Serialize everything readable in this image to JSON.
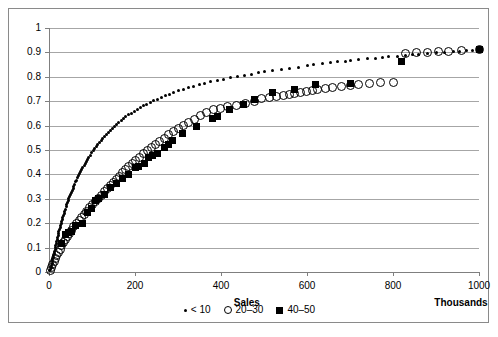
{
  "chart_data": {
    "type": "scatter",
    "title": "",
    "xlabel": "Sales",
    "xunits": "Thousands",
    "ylabel": "",
    "xlim": [
      0,
      1000
    ],
    "ylim": [
      0,
      1
    ],
    "grid": true,
    "legend_position": "bottom-center",
    "xticks": [
      "0",
      "200",
      "400",
      "600",
      "800",
      "1000"
    ],
    "xtick_values": [
      0,
      200,
      400,
      600,
      800,
      1000
    ],
    "yticks": [
      "0",
      "0.1",
      "0.2",
      "0.3",
      "0.4",
      "0.5",
      "0.6",
      "0.7",
      "0.8",
      "0.9",
      "1"
    ],
    "ytick_values": [
      0,
      0.1,
      0.2,
      0.3,
      0.4,
      0.5,
      0.6,
      0.7,
      0.8,
      0.9,
      1
    ],
    "series": [
      {
        "name": "< 10",
        "marker": "small-dot",
        "color": "#000000",
        "points": [
          [
            2,
            0.005
          ],
          [
            4,
            0.012
          ],
          [
            5,
            0.02
          ],
          [
            6,
            0.028
          ],
          [
            7,
            0.036
          ],
          [
            8,
            0.044
          ],
          [
            9,
            0.052
          ],
          [
            10,
            0.06
          ],
          [
            11,
            0.068
          ],
          [
            12,
            0.076
          ],
          [
            13,
            0.085
          ],
          [
            14,
            0.093
          ],
          [
            15,
            0.101
          ],
          [
            16,
            0.11
          ],
          [
            17,
            0.118
          ],
          [
            18,
            0.126
          ],
          [
            19,
            0.134
          ],
          [
            20,
            0.142
          ],
          [
            21,
            0.15
          ],
          [
            22,
            0.158
          ],
          [
            23,
            0.166
          ],
          [
            25,
            0.175
          ],
          [
            26,
            0.183
          ],
          [
            27,
            0.191
          ],
          [
            28,
            0.199
          ],
          [
            30,
            0.208
          ],
          [
            31,
            0.216
          ],
          [
            32,
            0.224
          ],
          [
            34,
            0.233
          ],
          [
            35,
            0.241
          ],
          [
            37,
            0.25
          ],
          [
            38,
            0.258
          ],
          [
            40,
            0.267
          ],
          [
            41,
            0.275
          ],
          [
            43,
            0.284
          ],
          [
            45,
            0.292
          ],
          [
            46,
            0.301
          ],
          [
            48,
            0.309
          ],
          [
            50,
            0.318
          ],
          [
            52,
            0.326
          ],
          [
            54,
            0.335
          ],
          [
            56,
            0.343
          ],
          [
            58,
            0.352
          ],
          [
            60,
            0.36
          ],
          [
            62,
            0.369
          ],
          [
            64,
            0.377
          ],
          [
            66,
            0.386
          ],
          [
            69,
            0.394
          ],
          [
            71,
            0.403
          ],
          [
            74,
            0.411
          ],
          [
            76,
            0.42
          ],
          [
            79,
            0.428
          ],
          [
            82,
            0.437
          ],
          [
            84,
            0.445
          ],
          [
            87,
            0.454
          ],
          [
            90,
            0.462
          ],
          [
            93,
            0.471
          ],
          [
            96,
            0.479
          ],
          [
            99,
            0.488
          ],
          [
            103,
            0.496
          ],
          [
            106,
            0.505
          ],
          [
            110,
            0.513
          ],
          [
            113,
            0.522
          ],
          [
            117,
            0.53
          ],
          [
            121,
            0.538
          ],
          [
            125,
            0.547
          ],
          [
            129,
            0.555
          ],
          [
            133,
            0.563
          ],
          [
            138,
            0.572
          ],
          [
            142,
            0.58
          ],
          [
            147,
            0.588
          ],
          [
            152,
            0.596
          ],
          [
            157,
            0.604
          ],
          [
            162,
            0.612
          ],
          [
            168,
            0.62
          ],
          [
            173,
            0.628
          ],
          [
            179,
            0.636
          ],
          [
            185,
            0.644
          ],
          [
            191,
            0.651
          ],
          [
            198,
            0.659
          ],
          [
            205,
            0.666
          ],
          [
            212,
            0.674
          ],
          [
            219,
            0.681
          ],
          [
            227,
            0.688
          ],
          [
            235,
            0.695
          ],
          [
            243,
            0.702
          ],
          [
            252,
            0.709
          ],
          [
            261,
            0.716
          ],
          [
            270,
            0.723
          ],
          [
            280,
            0.729
          ],
          [
            290,
            0.736
          ],
          [
            301,
            0.742
          ],
          [
            312,
            0.748
          ],
          [
            324,
            0.755
          ],
          [
            336,
            0.761
          ],
          [
            349,
            0.767
          ],
          [
            362,
            0.773
          ],
          [
            376,
            0.779
          ],
          [
            391,
            0.784
          ],
          [
            406,
            0.79
          ],
          [
            422,
            0.796
          ],
          [
            438,
            0.801
          ],
          [
            455,
            0.806
          ],
          [
            470,
            0.811
          ],
          [
            487,
            0.816
          ],
          [
            500,
            0.82
          ],
          [
            520,
            0.825
          ],
          [
            540,
            0.83
          ],
          [
            560,
            0.835
          ],
          [
            580,
            0.84
          ],
          [
            600,
            0.845
          ],
          [
            615,
            0.849
          ],
          [
            635,
            0.853
          ],
          [
            655,
            0.857
          ],
          [
            672,
            0.861
          ],
          [
            690,
            0.864
          ],
          [
            700,
            0.866
          ],
          [
            720,
            0.87
          ],
          [
            740,
            0.874
          ],
          [
            760,
            0.877
          ],
          [
            775,
            0.879
          ],
          [
            790,
            0.882
          ],
          [
            810,
            0.885
          ],
          [
            830,
            0.888
          ],
          [
            845,
            0.89
          ],
          [
            860,
            0.892
          ],
          [
            880,
            0.895
          ],
          [
            900,
            0.898
          ],
          [
            920,
            0.9
          ],
          [
            940,
            0.903
          ],
          [
            955,
            0.905
          ],
          [
            970,
            0.907
          ],
          [
            985,
            0.909
          ],
          [
            1000,
            0.912
          ]
        ]
      },
      {
        "name": "20–30",
        "marker": "open-circle",
        "color": "#000000",
        "points": [
          [
            3,
            0.008
          ],
          [
            6,
            0.018
          ],
          [
            9,
            0.03
          ],
          [
            12,
            0.042
          ],
          [
            15,
            0.055
          ],
          [
            18,
            0.068
          ],
          [
            22,
            0.081
          ],
          [
            26,
            0.094
          ],
          [
            30,
            0.107
          ],
          [
            34,
            0.12
          ],
          [
            38,
            0.133
          ],
          [
            43,
            0.146
          ],
          [
            48,
            0.159
          ],
          [
            53,
            0.172
          ],
          [
            58,
            0.185
          ],
          [
            64,
            0.198
          ],
          [
            70,
            0.211
          ],
          [
            76,
            0.224
          ],
          [
            82,
            0.237
          ],
          [
            88,
            0.25
          ],
          [
            95,
            0.263
          ],
          [
            101,
            0.276
          ],
          [
            108,
            0.289
          ],
          [
            115,
            0.302
          ],
          [
            122,
            0.315
          ],
          [
            128,
            0.328
          ],
          [
            135,
            0.341
          ],
          [
            142,
            0.354
          ],
          [
            149,
            0.367
          ],
          [
            156,
            0.38
          ],
          [
            163,
            0.393
          ],
          [
            170,
            0.406
          ],
          [
            178,
            0.419
          ],
          [
            186,
            0.432
          ],
          [
            194,
            0.445
          ],
          [
            202,
            0.458
          ],
          [
            210,
            0.471
          ],
          [
            219,
            0.484
          ],
          [
            228,
            0.497
          ],
          [
            238,
            0.51
          ],
          [
            248,
            0.523
          ],
          [
            258,
            0.536
          ],
          [
            268,
            0.549
          ],
          [
            278,
            0.562
          ],
          [
            289,
            0.575
          ],
          [
            300,
            0.588
          ],
          [
            312,
            0.601
          ],
          [
            325,
            0.614
          ],
          [
            338,
            0.627
          ],
          [
            352,
            0.64
          ],
          [
            367,
            0.653
          ],
          [
            382,
            0.664
          ],
          [
            398,
            0.672
          ],
          [
            415,
            0.678
          ],
          [
            435,
            0.684
          ],
          [
            458,
            0.69
          ],
          [
            478,
            0.7
          ],
          [
            495,
            0.71
          ],
          [
            512,
            0.714
          ],
          [
            528,
            0.718
          ],
          [
            545,
            0.722
          ],
          [
            560,
            0.726
          ],
          [
            572,
            0.73
          ],
          [
            585,
            0.734
          ],
          [
            598,
            0.738
          ],
          [
            612,
            0.742
          ],
          [
            625,
            0.748
          ],
          [
            642,
            0.753
          ],
          [
            660,
            0.758
          ],
          [
            680,
            0.762
          ],
          [
            700,
            0.766
          ],
          [
            720,
            0.769
          ],
          [
            745,
            0.772
          ],
          [
            770,
            0.775
          ],
          [
            800,
            0.778
          ],
          [
            830,
            0.896
          ],
          [
            855,
            0.898
          ],
          [
            880,
            0.9
          ],
          [
            905,
            0.902
          ],
          [
            930,
            0.904
          ],
          [
            960,
            0.908
          ],
          [
            1000,
            0.912
          ]
        ]
      },
      {
        "name": "40–50",
        "marker": "filled-square",
        "color": "#000000",
        "points": [
          [
            30,
            0.115
          ],
          [
            38,
            0.155
          ],
          [
            45,
            0.163
          ],
          [
            52,
            0.168
          ],
          [
            62,
            0.19
          ],
          [
            78,
            0.2
          ],
          [
            90,
            0.245
          ],
          [
            98,
            0.262
          ],
          [
            108,
            0.295
          ],
          [
            115,
            0.302
          ],
          [
            128,
            0.318
          ],
          [
            142,
            0.345
          ],
          [
            158,
            0.362
          ],
          [
            172,
            0.382
          ],
          [
            186,
            0.398
          ],
          [
            200,
            0.428
          ],
          [
            208,
            0.432
          ],
          [
            222,
            0.445
          ],
          [
            232,
            0.468
          ],
          [
            240,
            0.478
          ],
          [
            252,
            0.485
          ],
          [
            268,
            0.512
          ],
          [
            278,
            0.522
          ],
          [
            288,
            0.54
          ],
          [
            310,
            0.568
          ],
          [
            342,
            0.598
          ],
          [
            380,
            0.628
          ],
          [
            392,
            0.638
          ],
          [
            420,
            0.668
          ],
          [
            452,
            0.688
          ],
          [
            478,
            0.705
          ],
          [
            520,
            0.735
          ],
          [
            570,
            0.748
          ],
          [
            620,
            0.768
          ],
          [
            700,
            0.772
          ],
          [
            820,
            0.862
          ],
          [
            1000,
            0.912
          ]
        ]
      }
    ]
  },
  "legend": {
    "entries": [
      {
        "label": "< 10",
        "marker": "small-dot"
      },
      {
        "label": "20–30",
        "marker": "open-circle"
      },
      {
        "label": "40–50",
        "marker": "filled-square"
      }
    ]
  }
}
